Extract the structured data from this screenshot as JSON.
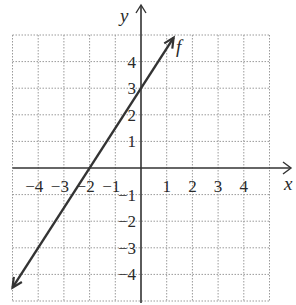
{
  "chart_data": {
    "type": "line",
    "title": "",
    "xlabel": "x",
    "ylabel": "y",
    "xlim": [
      -5,
      5
    ],
    "ylim": [
      -5,
      5
    ],
    "grid": true,
    "x_ticks": [
      -4,
      -3,
      -2,
      -1,
      1,
      2,
      3,
      4
    ],
    "y_ticks": [
      4,
      3,
      2,
      1,
      -1,
      -2,
      -3,
      -4
    ],
    "x_tick_labels": [
      "−4",
      "−3",
      "−2",
      "−1",
      "1",
      "2",
      "3",
      "4"
    ],
    "y_tick_labels": [
      "4",
      "3",
      "2",
      "1",
      "−1",
      "−2",
      "−3",
      "−4"
    ],
    "series": [
      {
        "name": "f",
        "equation": "y = 1.5x + 3",
        "x": [
          -5.0,
          1.27
        ],
        "y": [
          -4.5,
          4.9
        ],
        "points_on_line": [
          [
            -2,
            0
          ],
          [
            0,
            3
          ]
        ],
        "arrows_both_ends": true,
        "color": "#333333"
      }
    ],
    "annotations": [
      {
        "text": "f",
        "x": 1.4,
        "y": 4.5
      }
    ]
  },
  "labels": {
    "x_axis": "x",
    "y_axis": "y",
    "curve": "f"
  }
}
